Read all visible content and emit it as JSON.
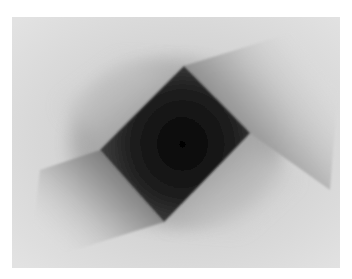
{
  "image": {
    "description": "Grayscale abstract: dark rotated square with two soft shadow vanes on a light gray field",
    "colors": {
      "border": "#ffffff",
      "field": "#d9d9d9",
      "field_light": "#e4e4e4",
      "square_dark": "#0a0a0a",
      "square_edge": "#3a3a3a",
      "shadow": "#8c8c8c"
    }
  }
}
